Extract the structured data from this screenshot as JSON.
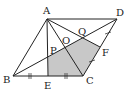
{
  "diagram": {
    "type": "geometry",
    "labels": {
      "A": "A",
      "B": "B",
      "C": "C",
      "D": "D",
      "E": "E",
      "F": "F",
      "O": "O",
      "P": "P",
      "Q": "Q"
    },
    "colors": {
      "line": "#222222",
      "shade": "#c8c8c8"
    },
    "tick_marks": {
      "BE_EC": "||",
      "CF_FD": "/"
    }
  }
}
